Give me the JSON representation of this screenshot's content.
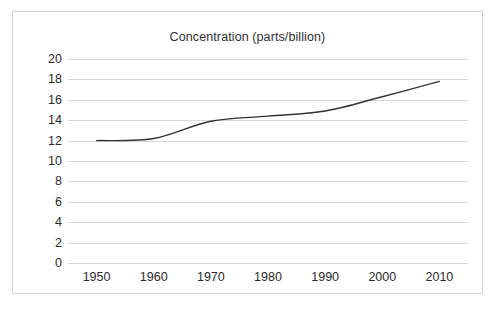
{
  "chart_data": {
    "type": "line",
    "title": "Concentration (parts/billion)",
    "xlabel": "",
    "ylabel": "",
    "x": [
      1950,
      1960,
      1970,
      1980,
      1990,
      2000,
      2010
    ],
    "categories": [
      "1950",
      "1960",
      "1970",
      "1980",
      "1990",
      "2000",
      "2010"
    ],
    "series": [
      {
        "name": "Concentration",
        "values": [
          12.0,
          12.2,
          13.9,
          14.4,
          14.9,
          16.3,
          17.8
        ],
        "color": "#333333"
      }
    ],
    "xlim": [
      1945,
      2015
    ],
    "ylim": [
      0,
      20
    ],
    "xticks": [
      1950,
      1960,
      1970,
      1980,
      1990,
      2000,
      2010
    ],
    "xtick_labels": [
      "1950",
      "1960",
      "1970",
      "1980",
      "1990",
      "2000",
      "2010"
    ],
    "yticks": [
      0,
      2,
      4,
      6,
      8,
      10,
      12,
      14,
      16,
      18,
      20
    ],
    "ytick_labels": [
      "0",
      "2",
      "4",
      "6",
      "8",
      "10",
      "12",
      "14",
      "16",
      "18",
      "20"
    ],
    "grid": "horizontal",
    "legend": "none",
    "gridline_color": "#d9d9d9",
    "frame_color": "#d4d4d4",
    "text_color": "#2b2b2b",
    "background": "#ffffff"
  }
}
